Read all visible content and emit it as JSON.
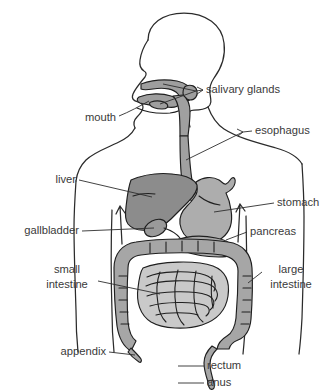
{
  "figure": {
    "title_clipped": "",
    "background_color": "#ffffff",
    "label_color": "#3a3a3a",
    "leader_color": "#2e2e2e",
    "outline_color": "#2b2b2b"
  },
  "palette": {
    "liver_fill": "#8c8c8c",
    "stomach_fill": "#adadad",
    "gallbladder_fill": "#9a9a9a",
    "pancreas_fill": "#a8a8a8",
    "esophagus_fill": "#a0a0a0",
    "large_intestine_fill": "#a6a6a6",
    "small_intestine_fill": "#c9c9c9",
    "mouth_fill": "#9e9e9e",
    "body_fill": "#ffffff"
  },
  "labels": {
    "salivary_glands": "salivary glands",
    "mouth": "mouth",
    "esophagus": "esophagus",
    "liver": "liver",
    "stomach": "stomach",
    "gallbladder": "gallbladder",
    "pancreas": "pancreas",
    "small_intestine_line1": "small",
    "small_intestine_line2": "intestine",
    "large_intestine_line1": "large",
    "large_intestine_line2": "intestine",
    "appendix": "appendix",
    "rectum": "rectum",
    "anus": "anus"
  },
  "label_positions": {
    "salivary_glands": {
      "x": 206,
      "y": 90,
      "anchor": "start"
    },
    "mouth": {
      "x": 116,
      "y": 118,
      "anchor": "end"
    },
    "esophagus": {
      "x": 255,
      "y": 131,
      "anchor": "start"
    },
    "liver": {
      "x": 76,
      "y": 180,
      "anchor": "end"
    },
    "stomach": {
      "x": 277,
      "y": 203,
      "anchor": "start"
    },
    "gallbladder": {
      "x": 79,
      "y": 231,
      "anchor": "end"
    },
    "pancreas": {
      "x": 250,
      "y": 232,
      "anchor": "start"
    },
    "small_intestine": {
      "x": 67,
      "y": 275,
      "anchor": "middle"
    },
    "large_intestine": {
      "x": 291,
      "y": 275,
      "anchor": "middle"
    },
    "appendix": {
      "x": 106,
      "y": 352,
      "anchor": "end"
    },
    "rectum": {
      "x": 207,
      "y": 366,
      "anchor": "start"
    },
    "anus": {
      "x": 207,
      "y": 383,
      "anchor": "start"
    }
  }
}
